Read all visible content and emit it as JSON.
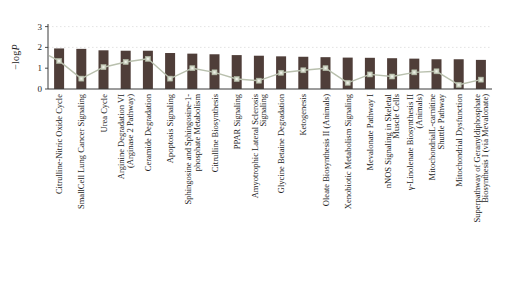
{
  "figure": {
    "background": "#ffffff",
    "ylabel_prefix": "−log",
    "ylabel_italic": "P",
    "colors": {
      "bar": "#4f3e39",
      "line": "#b9c0ae",
      "marker_fill": "#cdd3c2",
      "marker_edge": "#aeb6a2",
      "marker_center": "#eef0e8",
      "grid": "#dcdcdc",
      "axis": "#3a3a3a",
      "text": "#1c1c1c"
    }
  },
  "chart_data": {
    "type": "bar",
    "title": "",
    "xlabel": "",
    "ylabel": "−logP",
    "ylim": [
      0,
      3.1
    ],
    "yticks": [
      0,
      1,
      2,
      3
    ],
    "grid_lines_at": [
      2,
      3
    ],
    "legend": null,
    "categories": [
      "Citrulline-Nitric Oxide Cycle",
      "SmallCell Lung Cancer Signaling",
      "Urea Cycle",
      "Arginine Degradation VI\n(Arginase 2 Pathway)",
      "Ceramide Degradation",
      "Apoptosis Signaling",
      "Sphingosine and Sphingosine-1-\nphosphate Metabolism",
      "Citrulline Biosynthesis",
      "PPAR Signaling",
      "Amyotrophic Lateral Sclerosis\nSignaling",
      "Glycine Betaine Degradation",
      "Ketogenesis",
      "Oleate Biosynthesis II (Animals)",
      "Xenobiotic Metabolism Signaling",
      "Mevalonate Pathway I",
      "nNOS Signaling in Skeletal\nMuscle Cells",
      "γ-Linolenate Biosynthesis II\n(Animals)",
      "MitochondrialL-carnitine\nShuttle Pathway",
      "Mitochondrial Dysfunction",
      "Superpathway of Geranyldiphosphate\nBiosynthesis I (via Mevalonate)"
    ],
    "series": [
      {
        "name": "−logP",
        "type": "bar",
        "values": [
          1.95,
          1.93,
          1.86,
          1.84,
          1.84,
          1.73,
          1.7,
          1.67,
          1.63,
          1.6,
          1.57,
          1.55,
          1.53,
          1.51,
          1.5,
          1.48,
          1.46,
          1.43,
          1.43,
          1.4
        ]
      },
      {
        "name": "overlay line",
        "type": "line",
        "values": [
          1.35,
          0.5,
          1.05,
          1.3,
          1.45,
          0.5,
          1.0,
          0.8,
          0.48,
          0.4,
          0.78,
          0.9,
          1.0,
          0.3,
          0.7,
          0.6,
          0.8,
          0.85,
          0.2,
          0.45
        ],
        "leadin_value": 1.6
      }
    ]
  }
}
